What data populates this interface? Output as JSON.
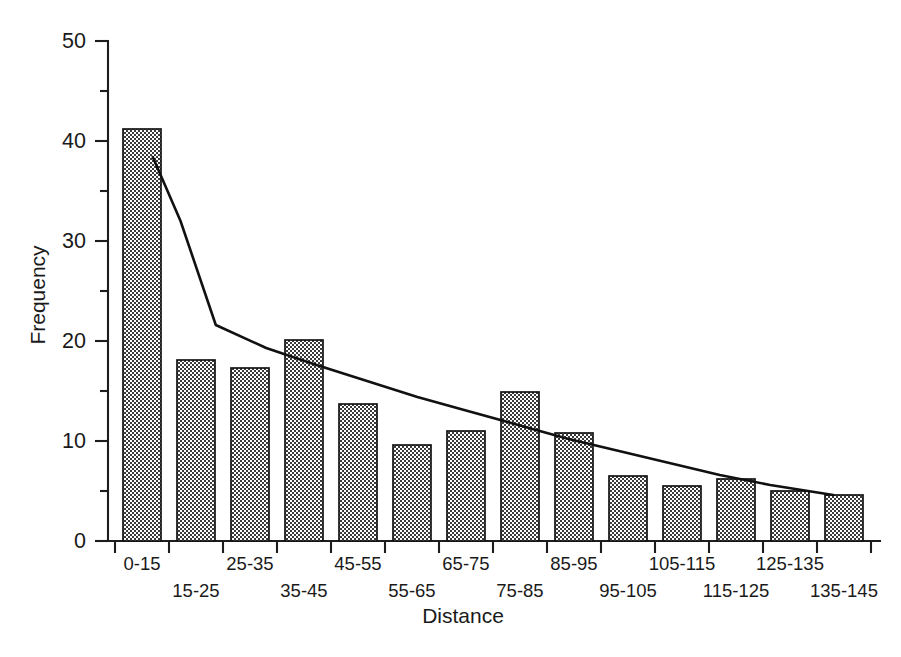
{
  "chart_data": {
    "type": "bar",
    "title": "",
    "xlabel": "Distance",
    "ylabel": "Frequency",
    "categories": [
      "0-15",
      "15-25",
      "25-35",
      "35-45",
      "45-55",
      "55-65",
      "65-75",
      "75-85",
      "85-95",
      "95-105",
      "105-115",
      "115-125",
      "125-135",
      "135-145"
    ],
    "values": [
      41.2,
      18.1,
      17.3,
      20.1,
      13.7,
      9.6,
      11.0,
      14.9,
      10.8,
      6.5,
      5.5,
      6.2,
      5.0,
      4.6
    ],
    "ylim": [
      0,
      50
    ],
    "y_major_ticks": [
      0,
      10,
      20,
      30,
      40,
      50
    ],
    "y_minor_ticks": [
      5,
      15,
      25,
      35,
      45
    ],
    "y_tick_labels": [
      "0",
      "10",
      "20",
      "30",
      "40",
      "50"
    ],
    "grid": false,
    "legend": false,
    "legend_position": "none",
    "bar_fill": "#d2d2d2",
    "bar_edge": "#141414",
    "curve_color": "#111111",
    "overlay_series": {
      "name": "fitted-decay-curve",
      "type": "line",
      "points": [
        {
          "x": 7.5,
          "y": 38.4
        },
        {
          "x": 13.0,
          "y": 32.0
        },
        {
          "x": 20.0,
          "y": 21.6
        },
        {
          "x": 30.0,
          "y": 19.3
        },
        {
          "x": 40.0,
          "y": 17.6
        },
        {
          "x": 50.0,
          "y": 16.0
        },
        {
          "x": 60.0,
          "y": 14.4
        },
        {
          "x": 70.0,
          "y": 13.0
        },
        {
          "x": 80.0,
          "y": 11.6
        },
        {
          "x": 90.0,
          "y": 10.2
        },
        {
          "x": 100.0,
          "y": 9.0
        },
        {
          "x": 110.0,
          "y": 7.8
        },
        {
          "x": 120.0,
          "y": 6.6
        },
        {
          "x": 130.0,
          "y": 5.6
        },
        {
          "x": 142.5,
          "y": 4.6
        }
      ]
    }
  },
  "axis": {
    "x_label_text": "Distance",
    "y_label_text": "Frequency"
  }
}
